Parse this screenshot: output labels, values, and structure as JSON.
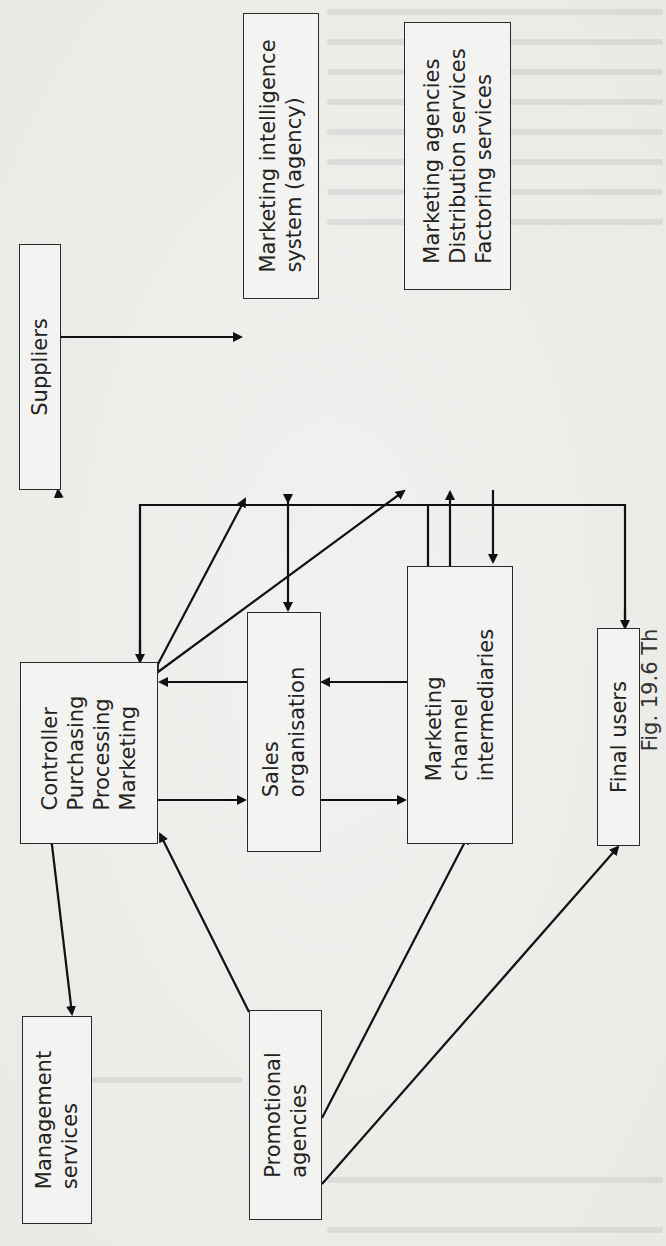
{
  "figure": {
    "caption_fragment": "Fig. 19.6 Th",
    "orientation": "rotated 90° counter-clockwise",
    "boxes": {
      "suppliers": {
        "lines": [
          "Suppliers"
        ]
      },
      "marketing_intelligence": {
        "lines": [
          "Marketing intelligence",
          "system (agency)"
        ]
      },
      "marketing_agencies": {
        "lines": [
          "Marketing agencies",
          "Distribution services",
          "Factoring services"
        ]
      },
      "controller": {
        "lines": [
          "Controller",
          "Purchasing",
          "Processing",
          "Marketing"
        ]
      },
      "sales_org": {
        "lines": [
          "Sales",
          "organisation"
        ]
      },
      "channel_intermediaries": {
        "lines": [
          "Marketing",
          "channel",
          "intermediaries"
        ]
      },
      "final_users": {
        "lines": [
          "Final users"
        ]
      },
      "management_services": {
        "lines": [
          "Management",
          "services"
        ]
      },
      "promotional_agencies": {
        "lines": [
          "Promotional",
          "agencies"
        ]
      }
    },
    "connections": [
      {
        "from": "Suppliers",
        "to": "Marketing intelligence system (agency)",
        "type": "bidirectional"
      },
      {
        "from": "Controller/Purchasing/Processing/Marketing",
        "to": "Suppliers",
        "type": "bidirectional"
      },
      {
        "from": "Controller/Purchasing/Processing/Marketing",
        "to": "Marketing intelligence system (agency)",
        "type": "bidirectional"
      },
      {
        "from": "Controller/Purchasing/Processing/Marketing",
        "to": "Marketing agencies/Distribution/Factoring",
        "type": "bidirectional"
      },
      {
        "from": "Marketing intelligence system (agency)",
        "to": "Sales organisation",
        "type": "bidirectional"
      },
      {
        "from": "Marketing channel intermediaries",
        "to": "Marketing agencies/Distribution/Factoring",
        "type": "bidirectional"
      },
      {
        "from": "Controller/Purchasing/Processing/Marketing",
        "to": "Sales organisation",
        "type": "bidirectional"
      },
      {
        "from": "Sales organisation",
        "to": "Marketing channel intermediaries",
        "type": "bidirectional"
      },
      {
        "from": "Marketing channel intermediaries",
        "to": "Controller/Purchasing/Processing/Marketing",
        "type": "directed"
      },
      {
        "from": "Marketing channel intermediaries",
        "to": "Final users",
        "type": "directed"
      },
      {
        "from": "Controller/Purchasing/Processing/Marketing",
        "to": "Management services",
        "type": "bidirectional"
      },
      {
        "from": "Promotional agencies",
        "to": "Controller/Purchasing/Processing/Marketing",
        "type": "directed"
      },
      {
        "from": "Promotional agencies",
        "to": "Marketing channel intermediaries",
        "type": "directed"
      },
      {
        "from": "Promotional agencies",
        "to": "Final users",
        "type": "directed"
      }
    ]
  }
}
